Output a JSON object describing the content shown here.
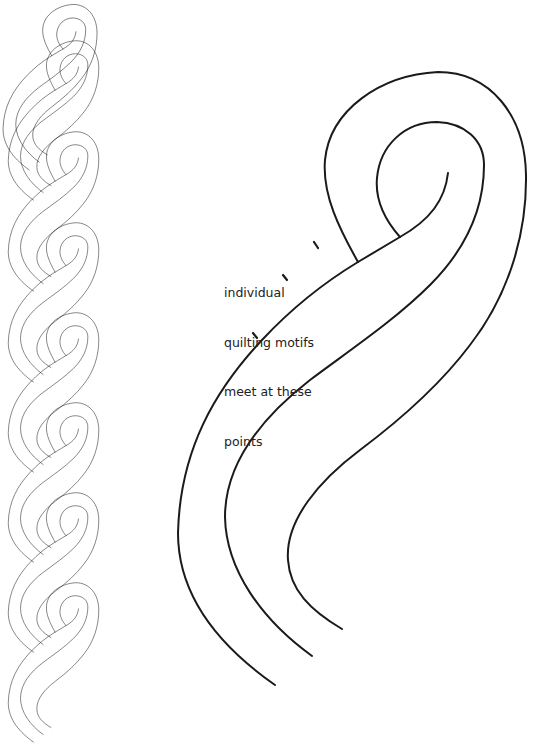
{
  "figure": {
    "stroke_color": "#1a1a1a",
    "background": "#ffffff"
  },
  "annotation": {
    "lines": [
      "individual",
      "quilting motifs",
      "meet at these",
      "points"
    ]
  },
  "chain_border": {
    "motif_count": 7
  },
  "large_motif": {
    "band_line_count": 3
  }
}
